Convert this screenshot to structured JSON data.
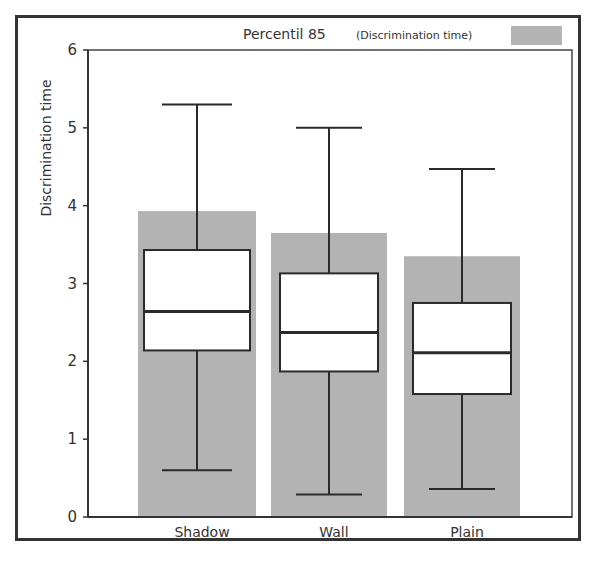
{
  "chart_data": {
    "type": "bar",
    "subtype": "bar-with-boxplot-overlay",
    "title": "",
    "xlabel": "",
    "ylabel": "Discrimination time",
    "ylim": [
      0,
      6
    ],
    "yticks": [
      0,
      1,
      2,
      3,
      4,
      5,
      6
    ],
    "grid": false,
    "legend": {
      "position": "top-right",
      "entries": [
        {
          "label": "Percentil 85",
          "sublabel": "(Discrimination time)",
          "color": "#b3b3b3"
        }
      ]
    },
    "categories": [
      "Shadow",
      "Wall",
      "Plain"
    ],
    "series": [
      {
        "name": "Percentil 85 (Discrimination time)",
        "kind": "bar",
        "color": "#b3b3b3",
        "values": [
          3.93,
          3.65,
          3.35
        ]
      }
    ],
    "boxplots": [
      {
        "category": "Shadow",
        "whisker_low": 0.6,
        "q1": 2.14,
        "median": 2.64,
        "q3": 3.43,
        "whisker_high": 5.3
      },
      {
        "category": "Wall",
        "whisker_low": 0.29,
        "q1": 1.87,
        "median": 2.37,
        "q3": 3.13,
        "whisker_high": 5.0
      },
      {
        "category": "Plain",
        "whisker_low": 0.36,
        "q1": 1.58,
        "median": 2.11,
        "q3": 2.75,
        "whisker_high": 4.47
      }
    ]
  },
  "labels": {
    "ylabel": "Discrimination time",
    "legend_main": "Percentil 85",
    "legend_sub": "(Discrimination time)",
    "categories": [
      "Shadow",
      "Wall",
      "Plain"
    ],
    "yticks": [
      "0",
      "1",
      "2",
      "3",
      "4",
      "5",
      "6"
    ]
  },
  "colors": {
    "bar": "#b3b3b3",
    "box_fill": "#ffffff",
    "line": "#2a2a2a",
    "frame": "#333333"
  }
}
